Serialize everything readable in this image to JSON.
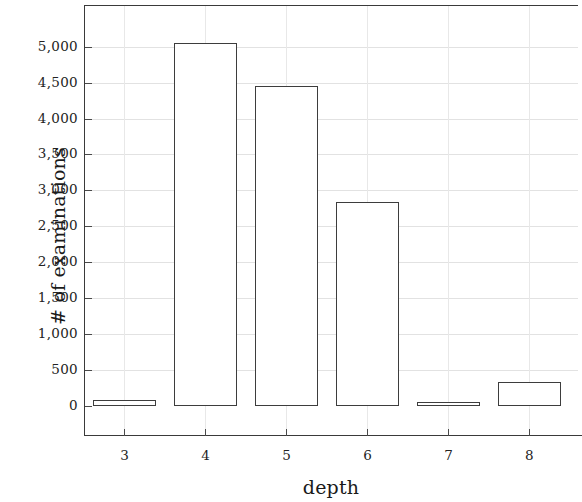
{
  "chart_data": {
    "type": "bar",
    "title": "",
    "xlabel": "depth",
    "ylabel": "# of examinations",
    "categories": [
      "3",
      "4",
      "5",
      "6",
      "7",
      "8"
    ],
    "values": [
      90,
      5050,
      4450,
      2840,
      55,
      330
    ],
    "xlim": [
      2.5,
      8.6
    ],
    "ylim": [
      0,
      5580
    ],
    "yticks": [
      0,
      500,
      1000,
      1500,
      2000,
      2500,
      3000,
      3500,
      4000,
      4500,
      5000
    ],
    "ytick_labels": [
      "0",
      "500",
      "1,000",
      "1,500",
      "2,000",
      "2,500",
      "3,000",
      "3,500",
      "4,000",
      "4,500",
      "5,000"
    ],
    "xticks": [
      3,
      4,
      5,
      6,
      7,
      8
    ],
    "xtick_labels": [
      "3",
      "4",
      "5",
      "6",
      "7",
      "8"
    ],
    "grid": true,
    "legend": null,
    "bar_width": 0.78,
    "bar_fill": "#ffffff",
    "bar_edge": "#3d3d3d",
    "grid_color": "#e2e2e2",
    "axis_color": "#3a3a3a"
  }
}
